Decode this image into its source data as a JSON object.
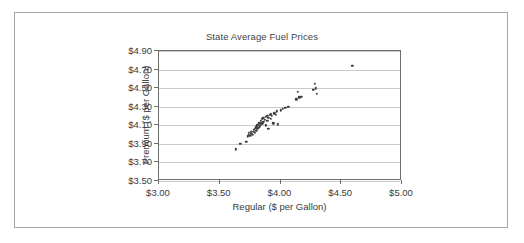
{
  "figure": {
    "title": "State Average Fuel Prices",
    "border_color": "#a6a6a6"
  },
  "chart_data": {
    "type": "scatter",
    "title": "State Average Fuel Prices",
    "xlabel": "Regular ($ per Gallon)",
    "ylabel": "Premium ($ per Gallon)",
    "xlim": [
      3.0,
      5.0
    ],
    "ylim": [
      3.5,
      4.9
    ],
    "xticks": [
      3.0,
      3.5,
      4.0,
      4.5,
      5.0
    ],
    "yticks": [
      3.5,
      3.7,
      3.9,
      4.1,
      4.3,
      4.5,
      4.7,
      4.9
    ],
    "xtick_labels": [
      "$3.00",
      "$3.50",
      "$4.00",
      "$4.50",
      "$5.00"
    ],
    "ytick_labels": [
      "$3.50",
      "$3.70",
      "$3.90",
      "$4.10",
      "$4.30",
      "$4.50",
      "$4.70",
      "$4.90"
    ],
    "grid": "horizontal",
    "legend": null,
    "marker_color": "#3d3d3d",
    "series": [
      {
        "name": "States",
        "x": [
          3.67,
          3.72,
          3.73,
          3.74,
          3.74,
          3.75,
          3.76,
          3.76,
          3.77,
          3.78,
          3.78,
          3.79,
          3.79,
          3.8,
          3.8,
          3.81,
          3.81,
          3.82,
          3.82,
          3.83,
          3.83,
          3.84,
          3.84,
          3.85,
          3.85,
          3.86,
          3.86,
          3.87,
          3.88,
          3.88,
          3.89,
          3.89,
          3.9,
          3.9,
          3.91,
          3.92,
          3.92,
          3.93,
          3.94,
          3.95,
          3.96,
          3.97,
          3.98,
          4.0,
          4.02,
          4.04,
          4.06,
          4.07,
          4.13,
          4.14,
          4.15,
          4.16,
          4.17,
          4.27,
          4.28,
          4.29,
          4.3,
          3.63,
          4.59
        ],
        "y": [
          3.9,
          3.92,
          3.98,
          4.0,
          4.02,
          3.99,
          4.01,
          4.03,
          4.0,
          4.03,
          4.05,
          4.02,
          4.06,
          4.04,
          4.08,
          4.06,
          4.1,
          4.07,
          4.12,
          4.09,
          4.13,
          4.11,
          4.15,
          4.12,
          4.17,
          4.14,
          4.18,
          4.16,
          4.1,
          4.19,
          4.15,
          4.2,
          4.06,
          4.18,
          4.21,
          4.17,
          4.22,
          4.2,
          4.12,
          4.23,
          4.21,
          4.25,
          4.11,
          4.26,
          4.28,
          4.29,
          4.3,
          4.3,
          4.38,
          4.46,
          4.4,
          4.4,
          4.41,
          4.48,
          4.55,
          4.5,
          4.44,
          3.84,
          4.74
        ]
      }
    ]
  }
}
